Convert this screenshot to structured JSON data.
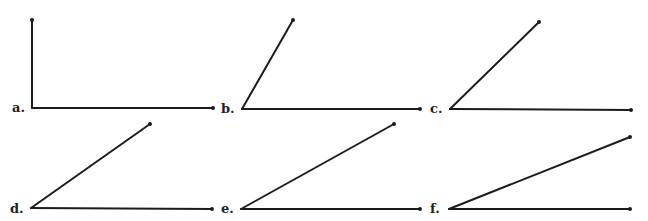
{
  "figure": {
    "line_color": "#1c1c1c",
    "angles": [
      {
        "label": "a.",
        "vertex": [
          32,
          108
        ],
        "end_base": [
          213,
          108
        ],
        "end_ray": [
          32,
          20
        ],
        "label_pos": [
          12,
          112
        ]
      },
      {
        "label": "b.",
        "vertex": [
          242,
          109
        ],
        "end_base": [
          420,
          109
        ],
        "end_ray": [
          293,
          20
        ],
        "label_pos": [
          221,
          113
        ]
      },
      {
        "label": "c.",
        "vertex": [
          450,
          109
        ],
        "end_base": [
          631,
          110
        ],
        "end_ray": [
          539,
          22
        ],
        "label_pos": [
          430,
          113
        ]
      },
      {
        "label": "d.",
        "vertex": [
          31,
          208
        ],
        "end_base": [
          212,
          209
        ],
        "end_ray": [
          150,
          124
        ],
        "label_pos": [
          10,
          213
        ]
      },
      {
        "label": "e.",
        "vertex": [
          241,
          209
        ],
        "end_base": [
          420,
          209
        ],
        "end_ray": [
          394,
          124
        ],
        "label_pos": [
          221,
          213
        ]
      },
      {
        "label": "f.",
        "vertex": [
          449,
          209
        ],
        "end_base": [
          630,
          209
        ],
        "end_ray": [
          630,
          137
        ],
        "label_pos": [
          430,
          213
        ]
      }
    ]
  }
}
